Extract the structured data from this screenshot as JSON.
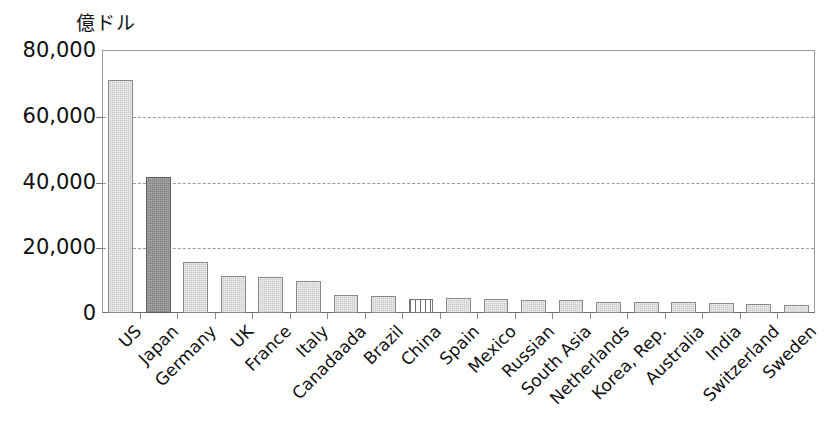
{
  "chart_data": {
    "type": "bar",
    "title": "",
    "subtitle": "",
    "xlabel": "",
    "ylabel": "億ドル",
    "ylim": [
      0,
      80000
    ],
    "ytick_labels": [
      "0",
      "20,000",
      "40,000",
      "60,000",
      "80,000"
    ],
    "ytick_values": [
      0,
      20000,
      40000,
      60000,
      80000
    ],
    "grid": true,
    "gridlines_at": [
      20000,
      40000,
      60000
    ],
    "legend": [],
    "legend_position": "none",
    "highlight_note": "Japan bar is rendered dark gray; China bar is rendered with vertical stripes",
    "categories": [
      "US",
      "Japan",
      "Germany",
      "UK",
      "France",
      "Italy",
      "Canadaada",
      "Brazil",
      "China",
      "Spain",
      "Mexico",
      "Russian",
      "South Asia",
      "Netherlands",
      "Korea, Rep.",
      "Australia",
      "India",
      "Switzerland",
      "Sweden"
    ],
    "values": [
      70800,
      41300,
      15400,
      11300,
      11100,
      9600,
      5500,
      5100,
      4300,
      4500,
      4300,
      4000,
      3900,
      3400,
      3300,
      3200,
      3100,
      2700,
      2400
    ],
    "bar_styles": [
      "light",
      "dark",
      "light",
      "light",
      "light",
      "light",
      "light",
      "light",
      "striped",
      "light",
      "light",
      "light",
      "light",
      "light",
      "light",
      "light",
      "light",
      "light",
      "light"
    ],
    "colors": {
      "bar_light": "#d5d5d5",
      "bar_light_border": "#8a8a8a",
      "bar_dark": "#8c8c8c",
      "bar_dark_border": "#5d5d5d",
      "bar_striped_line": "#6f6f6f",
      "gridline": "#9c9c9c",
      "frame": "#9a9a9a",
      "axis": "#6e6e6e",
      "text": "#111111",
      "background": "#ffffff"
    }
  }
}
